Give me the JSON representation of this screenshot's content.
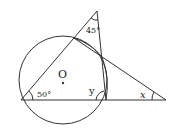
{
  "diagram": {
    "labels": {
      "center": "O",
      "angle_left": "50°",
      "angle_top": "45°",
      "angle_y": "y",
      "angle_x": "x"
    },
    "colors": {
      "stroke": "#333333",
      "background": "#ffffff"
    }
  }
}
